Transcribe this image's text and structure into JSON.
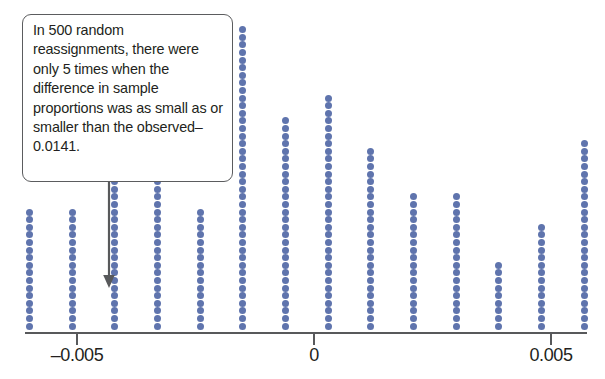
{
  "callout": {
    "text": "In 500 random reassignments, there were only 5 times when the difference in sample proportions was as small as or smaller than the observed–0.0141.",
    "border_color": "#5b5c5e"
  },
  "highlight": {
    "name": "orange-highlight-box",
    "color": "#e8714a",
    "x_from": -0.0205,
    "x_to": -0.0138
  },
  "colors": {
    "dot": "#5f74ad",
    "axis": "#58595b",
    "highlight": "#e8714a",
    "text": "#231f20"
  },
  "chart_data": {
    "type": "dotplot",
    "title": "",
    "xlabel": "",
    "ylabel": "",
    "xlim": [
      -0.0225,
      0.0215
    ],
    "grid": false,
    "legend": null,
    "n_total": 500,
    "dot_value": 1,
    "tick_values": [
      -0.02,
      -0.015,
      -0.01,
      -0.005,
      0,
      0.005,
      0.01,
      0.015,
      0.02
    ],
    "tick_labels": [
      "–0.020",
      "–0.015",
      "–0.010",
      "–0.005",
      "0",
      "0.005",
      "0.010",
      "0.015",
      "0.020"
    ],
    "annotations": [
      {
        "text": "observed difference",
        "value": -0.0141,
        "count_at_or_below": 5
      }
    ],
    "x": [
      -0.0205,
      -0.016,
      -0.015,
      -0.0141,
      -0.0132,
      -0.0123,
      -0.0114,
      -0.0105,
      -0.0096,
      -0.0087,
      -0.0078,
      -0.0069,
      -0.006,
      -0.0051,
      -0.0042,
      -0.0033,
      -0.0024,
      -0.0015,
      -0.0006,
      0.0003,
      0.0012,
      0.0021,
      0.003,
      0.0039,
      0.0048,
      0.0057,
      0.0066,
      0.0075,
      0.0084,
      0.0093,
      0.0102,
      0.0111,
      0.012,
      0.0129,
      0.0138,
      0.0147
    ],
    "counts": [
      1,
      1,
      3,
      3,
      2,
      6,
      1,
      8,
      4,
      9,
      2,
      15,
      16,
      16,
      21,
      25,
      16,
      40,
      28,
      31,
      24,
      18,
      18,
      9,
      14,
      25,
      12,
      10,
      8,
      4,
      11,
      4,
      1,
      2,
      2,
      1
    ]
  }
}
